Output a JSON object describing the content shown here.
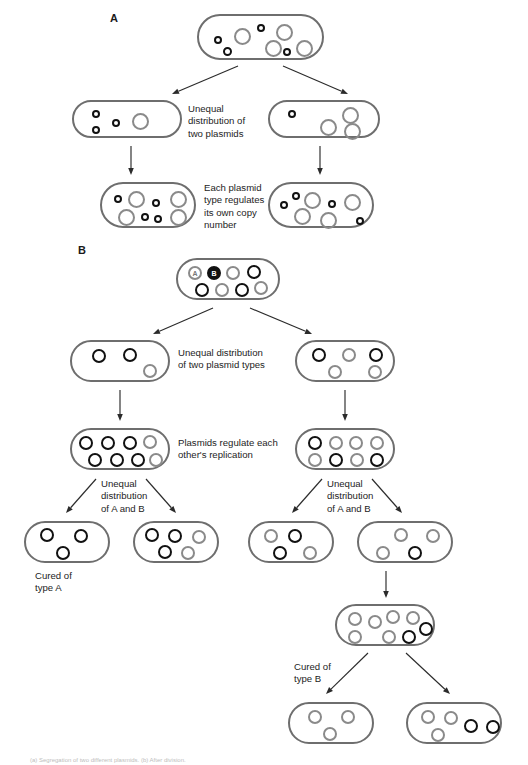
{
  "figure": {
    "width": 528,
    "height": 765,
    "background": "#ffffff",
    "colors": {
      "cell_outline": "#6e6e6e",
      "plasmid_gray": "#8a8a8a",
      "plasmid_black": "#111111",
      "arrow": "#2b2b2b",
      "text": "#1d1d1d"
    }
  },
  "panels": [
    {
      "id": "panel-a",
      "letter": "A",
      "x": 110,
      "y": 12
    },
    {
      "id": "panel-b",
      "letter": "B",
      "x": 78,
      "y": 244
    }
  ],
  "labels": {
    "unequal_two_plasmids": "Unequal\ndistribution of\ntwo plasmids",
    "each_plasmid_regulates": "Each plasmid\ntype regulates\nits own copy\nnumber",
    "unequal_two_plasmid_types": "Unequal distribution\nof two plasmid types",
    "plasmids_regulate_each_other": "Plasmids regulate each\nother's replication",
    "unequal_a_and_b_left": "Unequal\ndistribution\nof A and B",
    "unequal_a_and_b_right": "Unequal\ndistribution\nof A and B",
    "cured_of_type_a": "Cured of\ntype A",
    "cured_of_type_b": "Cured of\ntype B",
    "plasmid_tag_a": "A",
    "plasmid_tag_b": "B"
  },
  "caption": "(a) Segregation of two different plasmids.   (b) After division.",
  "cells": [
    {
      "name": "cell-a-parent",
      "x": 197,
      "y": 14,
      "w": 127,
      "h": 46,
      "r": 23,
      "plasmids": [
        {
          "type": "gray",
          "cx": 43,
          "cy": 20,
          "d": 17
        },
        {
          "type": "gray",
          "cx": 85,
          "cy": 16,
          "d": 17
        },
        {
          "type": "gray",
          "cx": 74,
          "cy": 32,
          "d": 17
        },
        {
          "type": "gray",
          "cx": 105,
          "cy": 32,
          "d": 17
        },
        {
          "type": "dot",
          "cx": 19,
          "cy": 24,
          "d": 8
        },
        {
          "type": "dot",
          "cx": 28,
          "cy": 35,
          "d": 9
        },
        {
          "type": "dot",
          "cx": 62,
          "cy": 12,
          "d": 8
        },
        {
          "type": "dot",
          "cx": 88,
          "cy": 36,
          "d": 8
        }
      ]
    },
    {
      "name": "cell-a-left-daughter",
      "x": 72,
      "y": 100,
      "w": 110,
      "h": 38,
      "r": 19,
      "plasmids": [
        {
          "type": "dot",
          "cx": 22,
          "cy": 12,
          "d": 8
        },
        {
          "type": "dot",
          "cx": 22,
          "cy": 28,
          "d": 8
        },
        {
          "type": "dot",
          "cx": 42,
          "cy": 21,
          "d": 8
        },
        {
          "type": "gray",
          "cx": 66,
          "cy": 19,
          "d": 17
        }
      ]
    },
    {
      "name": "cell-a-right-daughter",
      "x": 268,
      "y": 100,
      "w": 112,
      "h": 38,
      "r": 19,
      "plasmids": [
        {
          "type": "dot",
          "cx": 22,
          "cy": 12,
          "d": 8
        },
        {
          "type": "gray",
          "cx": 58,
          "cy": 25,
          "d": 17
        },
        {
          "type": "gray",
          "cx": 80,
          "cy": 13,
          "d": 17
        },
        {
          "type": "gray",
          "cx": 82,
          "cy": 29,
          "d": 17
        }
      ]
    },
    {
      "name": "cell-a-left-grandchild",
      "x": 100,
      "y": 182,
      "w": 96,
      "h": 46,
      "r": 23,
      "plasmids": [
        {
          "type": "gray",
          "cx": 34,
          "cy": 15,
          "d": 17
        },
        {
          "type": "gray",
          "cx": 76,
          "cy": 15,
          "d": 17
        },
        {
          "type": "gray",
          "cx": 24,
          "cy": 33,
          "d": 17
        },
        {
          "type": "gray",
          "cx": 76,
          "cy": 33,
          "d": 17
        },
        {
          "type": "dot",
          "cx": 16,
          "cy": 15,
          "d": 8
        },
        {
          "type": "dot",
          "cx": 54,
          "cy": 19,
          "d": 8
        },
        {
          "type": "dot",
          "cx": 43,
          "cy": 33,
          "d": 8
        },
        {
          "type": "dot",
          "cx": 56,
          "cy": 35,
          "d": 8
        }
      ]
    },
    {
      "name": "cell-a-right-grandchild",
      "x": 268,
      "y": 182,
      "w": 106,
      "h": 46,
      "r": 23,
      "plasmids": [
        {
          "type": "gray",
          "cx": 42,
          "cy": 16,
          "d": 17
        },
        {
          "type": "gray",
          "cx": 32,
          "cy": 32,
          "d": 17
        },
        {
          "type": "gray",
          "cx": 58,
          "cy": 36,
          "d": 17
        },
        {
          "type": "gray",
          "cx": 82,
          "cy": 18,
          "d": 17
        },
        {
          "type": "dot",
          "cx": 14,
          "cy": 21,
          "d": 8
        },
        {
          "type": "dot",
          "cx": 26,
          "cy": 12,
          "d": 8
        },
        {
          "type": "dot",
          "cx": 62,
          "cy": 20,
          "d": 8
        },
        {
          "type": "dot",
          "cx": 90,
          "cy": 37,
          "d": 8
        }
      ]
    },
    {
      "name": "cell-b-parent",
      "x": 176,
      "y": 258,
      "w": 104,
      "h": 42,
      "r": 21,
      "plasmids": [
        {
          "type": "tagA",
          "cx": 17,
          "cy": 13,
          "d": 14,
          "tag": "A"
        },
        {
          "type": "tagB",
          "cx": 36,
          "cy": 13,
          "d": 14,
          "tag": "B"
        },
        {
          "type": "gray",
          "cx": 55,
          "cy": 13,
          "d": 14
        },
        {
          "type": "black",
          "cx": 76,
          "cy": 12,
          "d": 14
        },
        {
          "type": "black",
          "cx": 24,
          "cy": 30,
          "d": 14
        },
        {
          "type": "gray",
          "cx": 44,
          "cy": 30,
          "d": 14
        },
        {
          "type": "black",
          "cx": 64,
          "cy": 30,
          "d": 14
        },
        {
          "type": "gray",
          "cx": 83,
          "cy": 28,
          "d": 14
        }
      ]
    },
    {
      "name": "cell-b-left-daughter",
      "x": 70,
      "y": 340,
      "w": 100,
      "h": 42,
      "r": 21,
      "plasmids": [
        {
          "type": "black",
          "cx": 27,
          "cy": 14,
          "d": 14
        },
        {
          "type": "black",
          "cx": 58,
          "cy": 13,
          "d": 14
        },
        {
          "type": "gray",
          "cx": 78,
          "cy": 29,
          "d": 14
        }
      ]
    },
    {
      "name": "cell-b-right-daughter",
      "x": 295,
      "y": 340,
      "w": 100,
      "h": 42,
      "r": 21,
      "plasmids": [
        {
          "type": "black",
          "cx": 22,
          "cy": 13,
          "d": 14
        },
        {
          "type": "gray",
          "cx": 52,
          "cy": 13,
          "d": 14
        },
        {
          "type": "black",
          "cx": 79,
          "cy": 13,
          "d": 14
        },
        {
          "type": "gray",
          "cx": 38,
          "cy": 30,
          "d": 14
        },
        {
          "type": "gray",
          "cx": 78,
          "cy": 30,
          "d": 14
        }
      ]
    },
    {
      "name": "cell-b-left-grandchild",
      "x": 70,
      "y": 428,
      "w": 100,
      "h": 42,
      "r": 21,
      "plasmids": [
        {
          "type": "black",
          "cx": 14,
          "cy": 13,
          "d": 14
        },
        {
          "type": "black",
          "cx": 36,
          "cy": 13,
          "d": 14
        },
        {
          "type": "black",
          "cx": 58,
          "cy": 13,
          "d": 14
        },
        {
          "type": "gray",
          "cx": 78,
          "cy": 12,
          "d": 14
        },
        {
          "type": "black",
          "cx": 23,
          "cy": 30,
          "d": 14
        },
        {
          "type": "black",
          "cx": 45,
          "cy": 30,
          "d": 14
        },
        {
          "type": "black",
          "cx": 66,
          "cy": 30,
          "d": 14
        },
        {
          "type": "gray",
          "cx": 84,
          "cy": 30,
          "d": 14
        }
      ]
    },
    {
      "name": "cell-b-right-grandchild",
      "x": 295,
      "y": 428,
      "w": 100,
      "h": 42,
      "r": 21,
      "plasmids": [
        {
          "type": "black",
          "cx": 18,
          "cy": 13,
          "d": 14
        },
        {
          "type": "gray",
          "cx": 39,
          "cy": 13,
          "d": 14
        },
        {
          "type": "gray",
          "cx": 59,
          "cy": 13,
          "d": 14
        },
        {
          "type": "gray",
          "cx": 80,
          "cy": 13,
          "d": 14
        },
        {
          "type": "gray",
          "cx": 18,
          "cy": 30,
          "d": 14
        },
        {
          "type": "black",
          "cx": 39,
          "cy": 30,
          "d": 14
        },
        {
          "type": "gray",
          "cx": 60,
          "cy": 30,
          "d": 14
        },
        {
          "type": "black",
          "cx": 80,
          "cy": 30,
          "d": 14
        }
      ]
    },
    {
      "name": "cell-b-cured-a",
      "x": 24,
      "y": 521,
      "w": 86,
      "h": 42,
      "r": 21,
      "plasmids": [
        {
          "type": "black",
          "cx": 21,
          "cy": 12,
          "d": 14
        },
        {
          "type": "black",
          "cx": 55,
          "cy": 13,
          "d": 14
        },
        {
          "type": "black",
          "cx": 37,
          "cy": 30,
          "d": 14
        }
      ]
    },
    {
      "name": "cell-b-mixed-1",
      "x": 133,
      "y": 521,
      "w": 86,
      "h": 42,
      "r": 21,
      "plasmids": [
        {
          "type": "black",
          "cx": 17,
          "cy": 12,
          "d": 14
        },
        {
          "type": "black",
          "cx": 40,
          "cy": 13,
          "d": 14
        },
        {
          "type": "gray",
          "cx": 64,
          "cy": 14,
          "d": 14
        },
        {
          "type": "black",
          "cx": 30,
          "cy": 29,
          "d": 14
        },
        {
          "type": "gray",
          "cx": 53,
          "cy": 30,
          "d": 14
        }
      ]
    },
    {
      "name": "cell-b-mixed-2",
      "x": 248,
      "y": 521,
      "w": 86,
      "h": 42,
      "r": 21,
      "plasmids": [
        {
          "type": "gray",
          "cx": 21,
          "cy": 13,
          "d": 14
        },
        {
          "type": "black",
          "cx": 45,
          "cy": 13,
          "d": 14
        },
        {
          "type": "black",
          "cx": 30,
          "cy": 30,
          "d": 14
        },
        {
          "type": "gray",
          "cx": 60,
          "cy": 30,
          "d": 14
        }
      ]
    },
    {
      "name": "cell-b-mixed-3",
      "x": 357,
      "y": 521,
      "w": 96,
      "h": 42,
      "r": 21,
      "plasmids": [
        {
          "type": "gray",
          "cx": 42,
          "cy": 12,
          "d": 14
        },
        {
          "type": "gray",
          "cx": 74,
          "cy": 13,
          "d": 14
        },
        {
          "type": "gray",
          "cx": 24,
          "cy": 30,
          "d": 14
        },
        {
          "type": "black",
          "cx": 56,
          "cy": 30,
          "d": 14
        }
      ]
    },
    {
      "name": "cell-b-expanded",
      "x": 335,
      "y": 604,
      "w": 100,
      "h": 42,
      "r": 21,
      "plasmids": [
        {
          "type": "gray",
          "cx": 18,
          "cy": 13,
          "d": 14
        },
        {
          "type": "gray",
          "cx": 38,
          "cy": 16,
          "d": 14
        },
        {
          "type": "gray",
          "cx": 56,
          "cy": 11,
          "d": 14
        },
        {
          "type": "gray",
          "cx": 76,
          "cy": 12,
          "d": 14
        },
        {
          "type": "black",
          "cx": 89,
          "cy": 23,
          "d": 14
        },
        {
          "type": "gray",
          "cx": 18,
          "cy": 31,
          "d": 14
        },
        {
          "type": "gray",
          "cx": 52,
          "cy": 31,
          "d": 14
        },
        {
          "type": "black",
          "cx": 72,
          "cy": 31,
          "d": 14
        }
      ]
    },
    {
      "name": "cell-b-cured-b",
      "x": 288,
      "y": 702,
      "w": 86,
      "h": 42,
      "r": 21,
      "plasmids": [
        {
          "type": "gray",
          "cx": 25,
          "cy": 13,
          "d": 14
        },
        {
          "type": "gray",
          "cx": 58,
          "cy": 13,
          "d": 14
        },
        {
          "type": "gray",
          "cx": 40,
          "cy": 30,
          "d": 14
        }
      ]
    },
    {
      "name": "cell-b-final-mixed",
      "x": 406,
      "y": 702,
      "w": 96,
      "h": 42,
      "r": 21,
      "plasmids": [
        {
          "type": "gray",
          "cx": 20,
          "cy": 13,
          "d": 14
        },
        {
          "type": "gray",
          "cx": 43,
          "cy": 14,
          "d": 14
        },
        {
          "type": "black",
          "cx": 63,
          "cy": 22,
          "d": 14
        },
        {
          "type": "black",
          "cx": 85,
          "cy": 23,
          "d": 14
        },
        {
          "type": "gray",
          "cx": 30,
          "cy": 31,
          "d": 14
        }
      ]
    }
  ],
  "arrows": [
    {
      "name": "arrow-a-split-left",
      "x1": 238,
      "y1": 66,
      "x2": 172,
      "y2": 94
    },
    {
      "name": "arrow-a-split-right",
      "x1": 283,
      "y1": 66,
      "x2": 348,
      "y2": 94
    },
    {
      "name": "arrow-a-left-down",
      "x1": 131,
      "y1": 146,
      "x2": 131,
      "y2": 175
    },
    {
      "name": "arrow-a-right-down",
      "x1": 320,
      "y1": 146,
      "x2": 320,
      "y2": 175
    },
    {
      "name": "arrow-b-split-left",
      "x1": 213,
      "y1": 308,
      "x2": 153,
      "y2": 334
    },
    {
      "name": "arrow-b-split-right",
      "x1": 250,
      "y1": 308,
      "x2": 312,
      "y2": 334
    },
    {
      "name": "arrow-b-left-down",
      "x1": 120,
      "y1": 390,
      "x2": 120,
      "y2": 421
    },
    {
      "name": "arrow-b-right-down",
      "x1": 345,
      "y1": 390,
      "x2": 345,
      "y2": 421
    },
    {
      "name": "arrow-b-l-split-left",
      "x1": 96,
      "y1": 479,
      "x2": 66,
      "y2": 513
    },
    {
      "name": "arrow-b-l-split-right",
      "x1": 146,
      "y1": 479,
      "x2": 176,
      "y2": 513
    },
    {
      "name": "arrow-b-r-split-left",
      "x1": 322,
      "y1": 479,
      "x2": 292,
      "y2": 513
    },
    {
      "name": "arrow-b-r-split-right",
      "x1": 372,
      "y1": 479,
      "x2": 402,
      "y2": 513
    },
    {
      "name": "arrow-b-mixed3-down",
      "x1": 386,
      "y1": 571,
      "x2": 386,
      "y2": 598
    },
    {
      "name": "arrow-b-final-left",
      "x1": 368,
      "y1": 653,
      "x2": 326,
      "y2": 694
    },
    {
      "name": "arrow-b-final-right",
      "x1": 406,
      "y1": 653,
      "x2": 450,
      "y2": 694
    }
  ],
  "notes": [
    {
      "name": "note-unequal-two-plasmids",
      "key": "unequal_two_plasmids",
      "x": 188,
      "y": 103,
      "w": 82,
      "align": "left"
    },
    {
      "name": "note-each-plasmid-regulates",
      "key": "each_plasmid_regulates",
      "x": 204,
      "y": 182,
      "w": 80,
      "align": "left"
    },
    {
      "name": "note-unequal-two-types",
      "key": "unequal_two_plasmid_types",
      "x": 178,
      "y": 347,
      "w": 112,
      "align": "left"
    },
    {
      "name": "note-plasmids-regulate",
      "key": "plasmids_regulate_each_other",
      "x": 178,
      "y": 437,
      "w": 112,
      "align": "left"
    },
    {
      "name": "note-unequal-ab-left",
      "key": "unequal_a_and_b_left",
      "x": 101,
      "y": 478,
      "w": 62,
      "align": "left"
    },
    {
      "name": "note-unequal-ab-right",
      "key": "unequal_a_and_b_right",
      "x": 327,
      "y": 478,
      "w": 62,
      "align": "left"
    },
    {
      "name": "note-cured-of-type-a",
      "key": "cured_of_type_a",
      "x": 35,
      "y": 570,
      "w": 70,
      "align": "left"
    },
    {
      "name": "note-cured-of-type-b",
      "key": "cured_of_type_b",
      "x": 294,
      "y": 661,
      "w": 70,
      "align": "left"
    }
  ]
}
